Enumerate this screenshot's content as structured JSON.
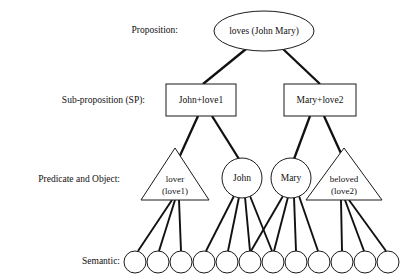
{
  "figure": {
    "width": 413,
    "height": 280,
    "background_color": "#ffffff",
    "line_color": "#111111"
  },
  "row_labels": [
    {
      "id": "proposition",
      "text": "Proposition:",
      "x": 178,
      "y": 31
    },
    {
      "id": "sub-proposition",
      "text": "Sub-proposition (SP):",
      "x": 145,
      "y": 101
    },
    {
      "id": "predicate-object",
      "text": "Predicate and Object:",
      "x": 120,
      "y": 180
    },
    {
      "id": "semantic",
      "text": "Semantic:",
      "x": 120,
      "y": 262
    }
  ],
  "proposition": {
    "label": "loves (John Mary)",
    "shape": "ellipse",
    "cx": 264,
    "cy": 31,
    "rx": 50,
    "ry": 20
  },
  "sub_propositions": [
    {
      "id": "sp-1",
      "label": "John+love1",
      "shape": "rect",
      "x": 166,
      "y": 84,
      "width": 70,
      "height": 32
    },
    {
      "id": "sp-2",
      "label": "Mary+love2",
      "shape": "rect",
      "x": 284,
      "y": 84,
      "width": 72,
      "height": 32
    }
  ],
  "predicates": [
    {
      "id": "pred-lover",
      "shape": "triangle",
      "line1": "lover",
      "line2": "(love1)",
      "cx": 175,
      "apex_y": 148,
      "base_y": 200,
      "half_width": 34
    },
    {
      "id": "pred-beloved",
      "shape": "triangle",
      "line1": "beloved",
      "line2": "(love2)",
      "cx": 344,
      "apex_y": 148,
      "base_y": 200,
      "half_width": 38
    }
  ],
  "objects": [
    {
      "id": "obj-john",
      "label": "John",
      "shape": "circle",
      "cx": 242,
      "cy": 178,
      "r": 20
    },
    {
      "id": "obj-mary",
      "label": "Mary",
      "shape": "circle",
      "cx": 291,
      "cy": 178,
      "r": 20
    }
  ],
  "semantic_nodes": [
    {
      "id": "sem-1",
      "cx": 135,
      "cy": 262,
      "r": 11
    },
    {
      "id": "sem-2",
      "cx": 158,
      "cy": 262,
      "r": 11
    },
    {
      "id": "sem-3",
      "cx": 181,
      "cy": 262,
      "r": 11
    },
    {
      "id": "sem-4",
      "cx": 204,
      "cy": 262,
      "r": 11
    },
    {
      "id": "sem-5",
      "cx": 227,
      "cy": 262,
      "r": 11
    },
    {
      "id": "sem-6",
      "cx": 250,
      "cy": 262,
      "r": 11
    },
    {
      "id": "sem-7",
      "cx": 273,
      "cy": 262,
      "r": 11
    },
    {
      "id": "sem-8",
      "cx": 296,
      "cy": 262,
      "r": 11
    },
    {
      "id": "sem-9",
      "cx": 319,
      "cy": 262,
      "r": 11
    },
    {
      "id": "sem-10",
      "cx": 342,
      "cy": 262,
      "r": 11
    },
    {
      "id": "sem-11",
      "cx": 365,
      "cy": 262,
      "r": 11
    },
    {
      "id": "sem-12",
      "cx": 388,
      "cy": 262,
      "r": 11
    }
  ],
  "edges": [
    {
      "id": "e-prop-sp1",
      "from": "proposition",
      "to": "sp-1",
      "x1": 246,
      "y1": 49,
      "x2": 203,
      "y2": 84,
      "weight": "thick"
    },
    {
      "id": "e-prop-sp2",
      "from": "proposition",
      "to": "sp-2",
      "x1": 283,
      "y1": 49,
      "x2": 320,
      "y2": 84,
      "weight": "thick"
    },
    {
      "id": "e-sp1-lover",
      "from": "sp-1",
      "to": "pred-lover",
      "x1": 198,
      "y1": 116,
      "x2": 178,
      "y2": 160,
      "weight": "thick"
    },
    {
      "id": "e-sp1-john",
      "from": "sp-1",
      "to": "obj-john",
      "x1": 212,
      "y1": 116,
      "x2": 239,
      "y2": 159,
      "weight": "thick"
    },
    {
      "id": "e-sp2-mary",
      "from": "sp-2",
      "to": "obj-mary",
      "x1": 310,
      "y1": 116,
      "x2": 294,
      "y2": 159,
      "weight": "thick"
    },
    {
      "id": "e-sp2-beloved",
      "from": "sp-2",
      "to": "pred-beloved",
      "x1": 324,
      "y1": 116,
      "x2": 344,
      "y2": 160,
      "weight": "thick"
    },
    {
      "id": "e-lover-sem1",
      "from": "pred-lover",
      "to": "sem-1",
      "x1": 172,
      "y1": 200,
      "x2": 138,
      "y2": 251,
      "weight": "med"
    },
    {
      "id": "e-lover-sem2",
      "from": "pred-lover",
      "to": "sem-2",
      "x1": 175,
      "y1": 200,
      "x2": 159,
      "y2": 251,
      "weight": "med"
    },
    {
      "id": "e-lover-sem3",
      "from": "pred-lover",
      "to": "sem-3",
      "x1": 179,
      "y1": 200,
      "x2": 181,
      "y2": 251,
      "weight": "med"
    },
    {
      "id": "e-john-sem4",
      "from": "obj-john",
      "to": "sem-4",
      "x1": 234,
      "y1": 196,
      "x2": 206,
      "y2": 251,
      "weight": "med"
    },
    {
      "id": "e-john-sem5",
      "from": "obj-john",
      "to": "sem-5",
      "x1": 239,
      "y1": 197,
      "x2": 228,
      "y2": 251,
      "weight": "med"
    },
    {
      "id": "e-john-sem6",
      "from": "obj-john",
      "to": "sem-6",
      "x1": 245,
      "y1": 197,
      "x2": 250,
      "y2": 251,
      "weight": "med"
    },
    {
      "id": "e-john-sem7",
      "from": "obj-john",
      "to": "sem-7",
      "x1": 250,
      "y1": 196,
      "x2": 272,
      "y2": 251,
      "weight": "med"
    },
    {
      "id": "e-mary-sem6",
      "from": "obj-mary",
      "to": "sem-6",
      "x1": 283,
      "y1": 196,
      "x2": 251,
      "y2": 251,
      "weight": "med"
    },
    {
      "id": "e-mary-sem7",
      "from": "obj-mary",
      "to": "sem-7",
      "x1": 288,
      "y1": 197,
      "x2": 274,
      "y2": 251,
      "weight": "med"
    },
    {
      "id": "e-mary-sem8",
      "from": "obj-mary",
      "to": "sem-8",
      "x1": 294,
      "y1": 197,
      "x2": 296,
      "y2": 251,
      "weight": "med"
    },
    {
      "id": "e-mary-sem9",
      "from": "obj-mary",
      "to": "sem-9",
      "x1": 299,
      "y1": 196,
      "x2": 318,
      "y2": 251,
      "weight": "med"
    },
    {
      "id": "e-beloved-sem10",
      "from": "pred-beloved",
      "to": "sem-10",
      "x1": 341,
      "y1": 200,
      "x2": 342,
      "y2": 251,
      "weight": "med"
    },
    {
      "id": "e-beloved-sem11",
      "from": "pred-beloved",
      "to": "sem-11",
      "x1": 345,
      "y1": 200,
      "x2": 364,
      "y2": 251,
      "weight": "med"
    },
    {
      "id": "e-beloved-sem12",
      "from": "pred-beloved",
      "to": "sem-12",
      "x1": 349,
      "y1": 200,
      "x2": 386,
      "y2": 251,
      "weight": "med"
    }
  ]
}
